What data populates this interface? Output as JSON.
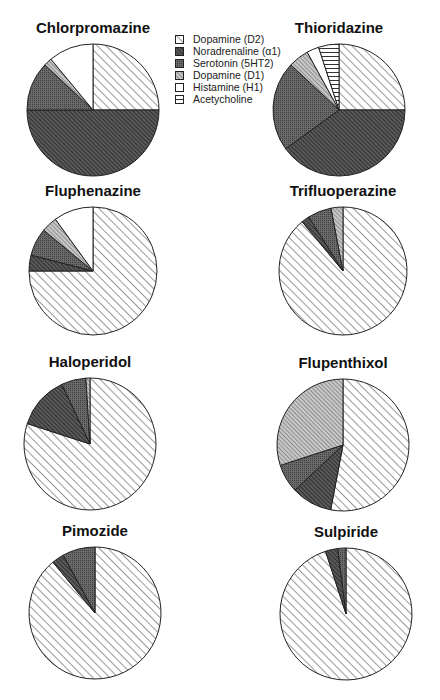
{
  "chart_data": {
    "type": "pie",
    "title": "",
    "legend": {
      "position": "top-center",
      "entries": [
        {
          "key": "d2",
          "label": "Dopamine (D2)"
        },
        {
          "key": "na",
          "label": "Noradrenaline (α1)"
        },
        {
          "key": "ser",
          "label": "Serotonin (5HT2)"
        },
        {
          "key": "d1",
          "label": "Dopamine (D1)"
        },
        {
          "key": "his",
          "label": "Histamine (H1)"
        },
        {
          "key": "ach",
          "label": "Acetycholine"
        }
      ]
    },
    "charts": [
      {
        "title": "Chlorpromazine",
        "cx": 93,
        "cy": 110,
        "r": 66,
        "slices": [
          {
            "key": "d2",
            "value": 25
          },
          {
            "key": "na",
            "value": 50
          },
          {
            "key": "ser",
            "value": 12
          },
          {
            "key": "d1",
            "value": 2
          },
          {
            "key": "his",
            "value": 11
          }
        ]
      },
      {
        "title": "Thioridazine",
        "cx": 339,
        "cy": 110,
        "r": 66,
        "slices": [
          {
            "key": "d2",
            "value": 25
          },
          {
            "key": "na",
            "value": 40
          },
          {
            "key": "ser",
            "value": 22
          },
          {
            "key": "d1",
            "value": 5
          },
          {
            "key": "his",
            "value": 3
          },
          {
            "key": "ach",
            "value": 5
          }
        ]
      },
      {
        "title": "Fluphenazine",
        "cx": 93,
        "cy": 271,
        "r": 64,
        "slices": [
          {
            "key": "d2",
            "value": 75
          },
          {
            "key": "na",
            "value": 4
          },
          {
            "key": "ser",
            "value": 7
          },
          {
            "key": "d1",
            "value": 4
          },
          {
            "key": "his",
            "value": 10
          }
        ]
      },
      {
        "title": "Trifluoperazine",
        "cx": 343,
        "cy": 271,
        "r": 64,
        "slices": [
          {
            "key": "d2",
            "value": 89
          },
          {
            "key": "na",
            "value": 2
          },
          {
            "key": "ser",
            "value": 6
          },
          {
            "key": "d1",
            "value": 3
          }
        ]
      },
      {
        "title": "Haloperidol",
        "cx": 90,
        "cy": 444,
        "r": 66,
        "slices": [
          {
            "key": "d2",
            "value": 80
          },
          {
            "key": "na",
            "value": 13
          },
          {
            "key": "ser",
            "value": 6
          },
          {
            "key": "d1",
            "value": 1
          }
        ]
      },
      {
        "title": "Flupenthixol",
        "cx": 343,
        "cy": 445,
        "r": 66,
        "slices": [
          {
            "key": "d2",
            "value": 53
          },
          {
            "key": "na",
            "value": 10
          },
          {
            "key": "ser",
            "value": 7
          },
          {
            "key": "d1",
            "value": 30
          }
        ]
      },
      {
        "title": "Pimozide",
        "cx": 95,
        "cy": 613,
        "r": 66,
        "slices": [
          {
            "key": "d2",
            "value": 89
          },
          {
            "key": "na",
            "value": 3
          },
          {
            "key": "ser",
            "value": 8
          }
        ]
      },
      {
        "title": "Sulpiride",
        "cx": 346,
        "cy": 614,
        "r": 66,
        "slices": [
          {
            "key": "d2",
            "value": 95
          },
          {
            "key": "na",
            "value": 3
          },
          {
            "key": "ser",
            "value": 2
          }
        ]
      }
    ],
    "unit": "percent of receptor affinity profile",
    "start_angle": "12 o'clock, clockwise"
  }
}
